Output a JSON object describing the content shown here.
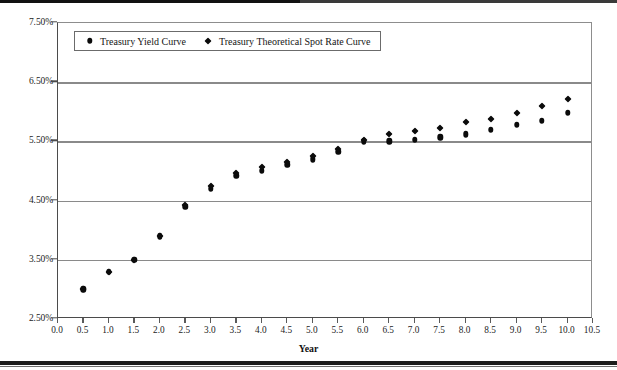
{
  "figure": {
    "background": "#ffffff",
    "marker_color": "#0b0b0b",
    "grid_color": "#8a8a8a",
    "axis_color": "#4b4b4b"
  },
  "legend": {
    "position": "top-left-inside",
    "entries": [
      {
        "label": "Treasury Yield Curve",
        "marker": "circle-marker-icon"
      },
      {
        "label": "Treasury Theoretical Spot Rate Curve",
        "marker": "diamond-marker-icon"
      }
    ]
  },
  "axes": {
    "x_title": "Year",
    "y_title": "",
    "x_ticks": [
      "0.0",
      "0.5",
      "1.0",
      "1.5",
      "2.0",
      "2.5",
      "3.0",
      "3.5",
      "4.0",
      "4.5",
      "5.0",
      "5.5",
      "6.0",
      "6.5",
      "7.0",
      "7.5",
      "8.0",
      "8.5",
      "9.0",
      "9.5",
      "10.0",
      "10.5"
    ],
    "y_ticks": [
      "2.50%",
      "3.50%",
      "4.50%",
      "5.50%",
      "6.50%",
      "7.50%"
    ]
  },
  "chart_data": {
    "type": "scatter",
    "title": "",
    "xlabel": "Year",
    "ylabel": "",
    "xlim": [
      0.0,
      10.5
    ],
    "ylim": [
      2.5,
      7.5
    ],
    "x_tick_step": 0.5,
    "y_tick_step": 1.0,
    "grid": "horizontal",
    "legend_position": "upper left",
    "x": [
      0.5,
      1.0,
      1.5,
      2.0,
      2.5,
      3.0,
      3.5,
      4.0,
      4.5,
      5.0,
      5.5,
      6.0,
      6.5,
      7.0,
      7.5,
      8.0,
      8.5,
      9.0,
      9.5,
      10.0
    ],
    "series": [
      {
        "name": "Treasury Yield Curve",
        "marker": "circle",
        "values": [
          3.0,
          3.3,
          3.5,
          3.9,
          4.4,
          4.7,
          4.92,
          5.0,
          5.1,
          5.2,
          5.32,
          5.5,
          5.5,
          5.53,
          5.57,
          5.62,
          5.7,
          5.78,
          5.85,
          5.98
        ]
      },
      {
        "name": "Treasury Theoretical Spot Rate Curve",
        "marker": "diamond",
        "values": [
          3.0,
          3.3,
          3.5,
          3.9,
          4.42,
          4.75,
          4.97,
          5.06,
          5.16,
          5.25,
          5.38,
          5.52,
          5.62,
          5.68,
          5.73,
          5.82,
          5.87,
          5.98,
          6.1,
          6.22
        ]
      }
    ]
  }
}
